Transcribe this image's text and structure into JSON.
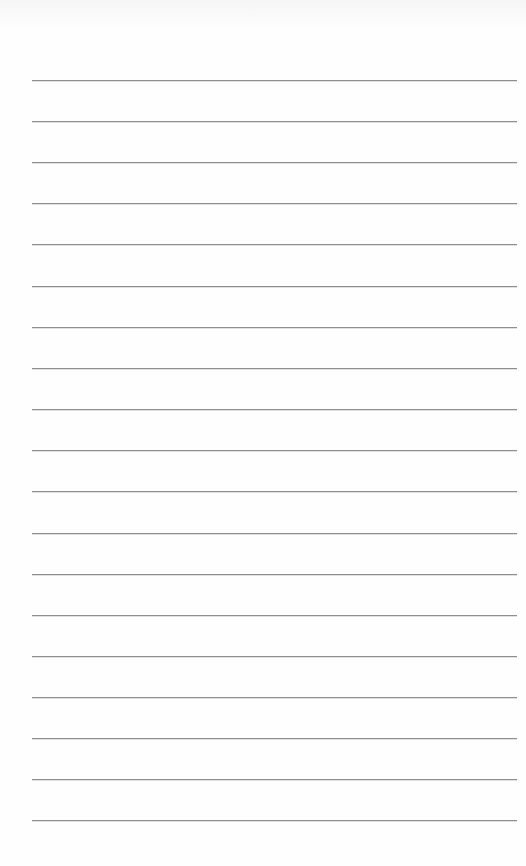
{
  "page": {
    "type": "ruled-notebook-page",
    "background_color": "#fefefe",
    "line_color": "#8e8e8e",
    "line_count": 19,
    "line_left": 32,
    "line_right": 517,
    "line_positions_y": [
      80,
      121,
      162,
      203,
      244,
      286,
      327,
      368,
      409,
      450,
      491,
      533,
      574,
      615,
      656,
      697,
      738,
      779,
      820
    ],
    "text_content": []
  }
}
